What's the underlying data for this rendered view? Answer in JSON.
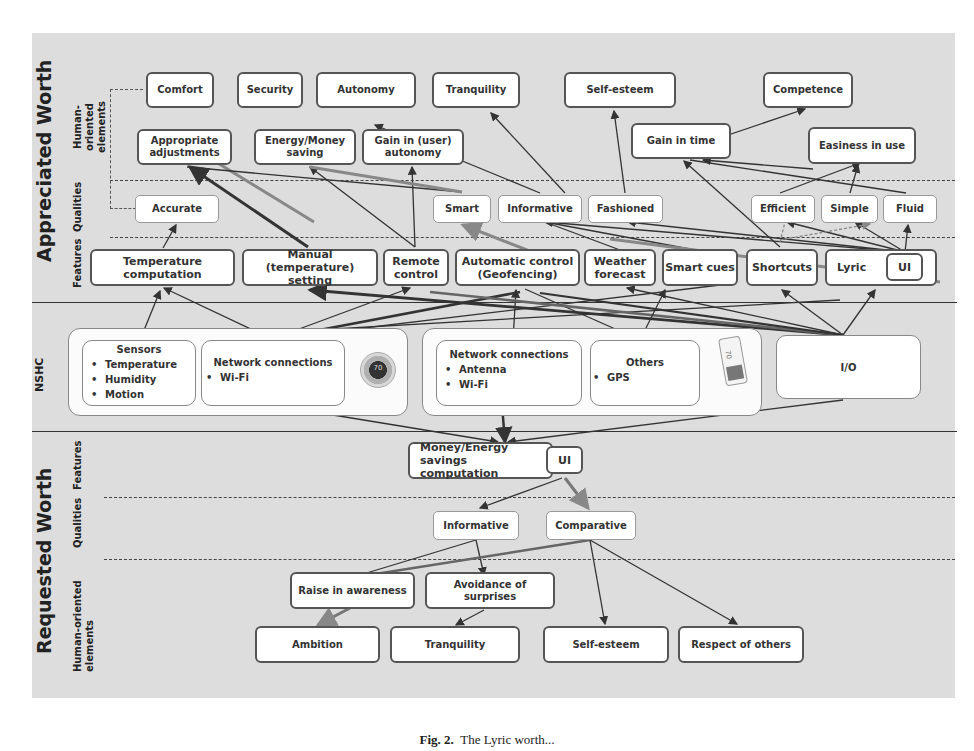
{
  "appreciated_worth": {
    "title": "Appreciated Worth",
    "row_labels": {
      "human_oriented": "Human-oriented elements",
      "qualities": "Qualities",
      "features": "Features"
    },
    "human_oriented_top": [
      "Comfort",
      "Security",
      "Autonomy",
      "Tranquility",
      "Self-esteem",
      "Competence"
    ],
    "human_oriented_mid": [
      "Appropriate adjustments",
      "Energy/Money saving",
      "Gain in (user) autonomy",
      "Gain in time",
      "Easiness in use"
    ],
    "qualities": [
      "Accurate",
      "Smart",
      "Informative",
      "Fashioned",
      "Efficient",
      "Simple",
      "Fluid"
    ],
    "features": [
      "Temperature computation",
      "Manual (temperature) setting",
      "Remote control",
      "Automatic control (Geofencing)",
      "Weather forecast",
      "Smart cues",
      "Shortcuts",
      "Lyric",
      "UI"
    ]
  },
  "nshc": {
    "label": "NSHC",
    "thermostat_group": {
      "sensors": {
        "title": "Sensors",
        "items": [
          "Temperature",
          "Humidity",
          "Motion"
        ]
      },
      "network": {
        "title": "Network connections",
        "items": [
          "Wi-Fi"
        ]
      },
      "device_icon": "thermostat-icon",
      "device_display": "70"
    },
    "phone_group": {
      "network": {
        "title": "Network connections",
        "items": [
          "Antenna",
          "Wi-Fi"
        ]
      },
      "others": {
        "title": "Others",
        "items": [
          "GPS"
        ]
      },
      "device_icon": "smartphone-icon",
      "device_display": "70"
    },
    "io": "I/O"
  },
  "requested_worth": {
    "title": "Requested Worth",
    "row_labels": {
      "features": "Features",
      "qualities": "Qualities",
      "human_oriented": "Human-oriented elements"
    },
    "features": {
      "main": "Money/Energy savings computation",
      "ui": "UI"
    },
    "qualities": [
      "Informative",
      "Comparative"
    ],
    "human_oriented_mid": [
      "Raise in awareness",
      "Avoidance of surprises"
    ],
    "human_oriented_bottom": [
      "Ambition",
      "Tranquility",
      "Self-esteem",
      "Respect of others"
    ]
  },
  "caption": {
    "label": "Fig. 2.",
    "text": "The Lyric worth..."
  },
  "colors": {
    "panel": "#dcdcdc",
    "box_border": "#555555",
    "edge": "#333333",
    "edge_light": "#888888"
  }
}
